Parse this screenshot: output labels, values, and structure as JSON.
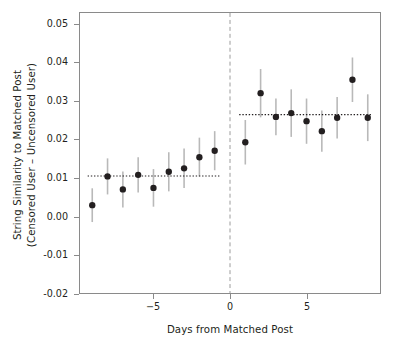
{
  "chart_data": {
    "type": "scatter",
    "title": "",
    "xlabel": "Days from Matched Post",
    "ylabel_line1": "String Similarity to Matched Post",
    "ylabel_line2": "(Censored User – Uncensored User)",
    "xlim": [
      -9.8,
      9.8
    ],
    "ylim": [
      -0.02,
      0.053
    ],
    "xticks": [
      -5,
      0,
      5
    ],
    "xtick_labels": [
      "−5",
      "0",
      "5"
    ],
    "yticks": [
      -0.02,
      -0.01,
      0.0,
      0.01,
      0.02,
      0.03,
      0.04,
      0.05
    ],
    "ytick_labels": [
      "-0.02",
      "-0.01",
      "0.00",
      "0.01",
      "0.02",
      "0.03",
      "0.04",
      "0.05"
    ],
    "grid": false,
    "legend": "none",
    "point_color": "#231f20",
    "errorbar_color": "#b9b9b9",
    "fit_line_color": "#231f20",
    "vline_color": "#9b9b9b",
    "vline_x": 0,
    "series": [
      {
        "name": "Pre-period (censored minus uncensored)",
        "x": [
          -9,
          -8,
          -7,
          -6,
          -5,
          -4,
          -3,
          -2,
          -1
        ],
        "values": [
          0.0029,
          0.0104,
          0.007,
          0.0108,
          0.0074,
          0.0116,
          0.0125,
          0.0154,
          0.0171
        ],
        "ci_low": [
          -0.0015,
          0.0057,
          0.0023,
          0.0062,
          0.0025,
          0.0065,
          0.0074,
          0.0104,
          0.012
        ],
        "ci_high": [
          0.0073,
          0.0151,
          0.0117,
          0.0154,
          0.0123,
          0.0167,
          0.0177,
          0.0205,
          0.0222
        ]
      },
      {
        "name": "Post-period (censored minus uncensored)",
        "x": [
          1,
          2,
          3,
          4,
          5,
          6,
          7,
          8,
          9
        ],
        "values": [
          0.0193,
          0.0321,
          0.0259,
          0.0269,
          0.0248,
          0.0222,
          0.0257,
          0.0356,
          0.0257
        ],
        "ci_low": [
          0.0135,
          0.0258,
          0.0211,
          0.0207,
          0.0189,
          0.0168,
          0.0203,
          0.0298,
          0.0196
        ],
        "ci_high": [
          0.0251,
          0.0384,
          0.0307,
          0.0331,
          0.0307,
          0.0276,
          0.0311,
          0.0414,
          0.0318
        ]
      }
    ],
    "fit_lines": [
      {
        "name": "pre-fit",
        "x_start": -9.3,
        "x_end": -0.6,
        "y": 0.0105,
        "style": "dotted"
      },
      {
        "name": "post-fit",
        "x_start": 0.6,
        "x_end": 9.3,
        "y": 0.0265,
        "style": "dotted"
      }
    ]
  }
}
